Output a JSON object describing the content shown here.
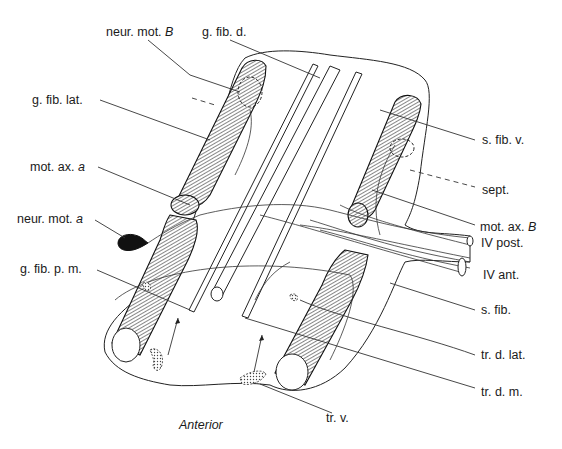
{
  "figure": {
    "orientation_label": "Anterior",
    "labels": {
      "neur_mot_B": {
        "text": "neur. mot. ",
        "suffix": "B"
      },
      "g_fib_d": {
        "text": "g. fib. d."
      },
      "g_fib_lat": {
        "text": "g. fib. lat."
      },
      "s_fib_v": {
        "text": "s. fib. v."
      },
      "mot_ax_a": {
        "text": "mot. ax. ",
        "suffix": "a"
      },
      "sept": {
        "text": "sept."
      },
      "neur_mot_a": {
        "text": "neur. mot. ",
        "suffix": "a"
      },
      "mot_ax_B": {
        "text": "mot. ax. ",
        "suffix": "B"
      },
      "IV_post": {
        "text": "IV post."
      },
      "IV_ant": {
        "text": "IV ant."
      },
      "g_fib_p_m": {
        "text": "g. fib. p. m."
      },
      "s_fib": {
        "text": "s. fib."
      },
      "tr_d_lat": {
        "text": "tr. d. lat."
      },
      "tr_d_m": {
        "text": "tr. d. m."
      },
      "tr_v": {
        "text": "tr. v."
      }
    },
    "colors": {
      "ink": "#1a1a1a",
      "background": "#ffffff"
    }
  }
}
